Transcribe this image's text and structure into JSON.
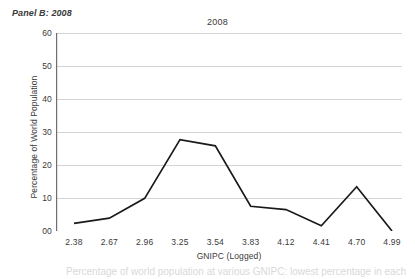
{
  "panel": {
    "label": "Panel B: 2008"
  },
  "figure": {
    "title": "2008"
  },
  "caption_fragment": "Percentage of world population at various GNIPC: lowest percentage in each",
  "chart_data": {
    "type": "line",
    "title": "2008",
    "xlabel": "GNIPC (Logged)",
    "ylabel": "Percentage of World Population",
    "x": [
      2.38,
      2.67,
      2.96,
      3.25,
      3.54,
      3.83,
      4.12,
      4.41,
      4.7,
      4.99
    ],
    "categories": [
      "2.38",
      "2.67",
      "2.96",
      "3.25",
      "3.54",
      "3.83",
      "4.12",
      "4.41",
      "4.70",
      "4.99"
    ],
    "values": [
      2.3,
      3.9,
      9.9,
      27.7,
      25.8,
      7.5,
      6.5,
      1.6,
      13.4,
      0.0
    ],
    "ylim": [
      0,
      60
    ],
    "yticks": [
      0,
      10,
      20,
      30,
      40,
      50,
      60
    ],
    "ytick_labels": [
      "00",
      "10",
      "20",
      "30",
      "40",
      "50",
      "60"
    ],
    "grid": "horizontal",
    "legend": "none",
    "series_color": "#1a1a1a",
    "grid_color": "#c9c9c9",
    "axis_color": "#808080"
  }
}
